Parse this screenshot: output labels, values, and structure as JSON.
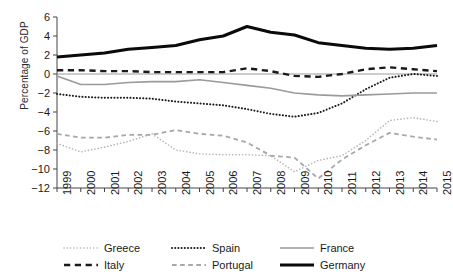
{
  "chart_data": {
    "type": "line",
    "title": "",
    "xlabel": "",
    "ylabel": "Percentage of GDP",
    "x": [
      1999,
      2000,
      2001,
      2002,
      2003,
      2004,
      2005,
      2006,
      2007,
      2008,
      2009,
      2010,
      2011,
      2012,
      2013,
      2014,
      2015
    ],
    "xlim": [
      1999,
      2015
    ],
    "ylim": [
      -12,
      6
    ],
    "yticks": [
      6,
      4,
      2,
      0,
      -2,
      -4,
      -6,
      -8,
      -10,
      -12
    ],
    "xticks": [
      "1999",
      "2000",
      "2001",
      "2002",
      "2003",
      "2004",
      "2005",
      "2006",
      "2007",
      "2008",
      "2009",
      "2010",
      "2011",
      "2012",
      "2013",
      "2014",
      "2015"
    ],
    "grid": false,
    "legend_position": "bottom",
    "zero_line": true,
    "series": [
      {
        "name": "Greece",
        "style": "dotted",
        "color": "#b4b4b4",
        "width": 1.6,
        "values": [
          -7.3,
          -8.2,
          -7.7,
          -7.1,
          -6.3,
          -8.0,
          -8.4,
          -8.5,
          -8.5,
          -8.6,
          -10.3,
          -9.1,
          -8.6,
          -7.0,
          -4.9,
          -4.6,
          -5.0
        ]
      },
      {
        "name": "Spain",
        "style": "dotted",
        "color": "#1a1a1a",
        "width": 2.0,
        "values": [
          -2.1,
          -2.4,
          -2.5,
          -2.5,
          -2.6,
          -2.9,
          -3.1,
          -3.3,
          -3.7,
          -4.2,
          -4.5,
          -4.1,
          -3.1,
          -1.6,
          -0.4,
          0.0,
          -0.2
        ]
      },
      {
        "name": "France",
        "style": "solid",
        "color": "#9a9a9a",
        "width": 1.6,
        "values": [
          -0.2,
          -1.1,
          -1.1,
          -0.9,
          -0.8,
          -0.8,
          -0.6,
          -0.9,
          -1.2,
          -1.5,
          -2.0,
          -2.2,
          -2.3,
          -2.2,
          -2.1,
          -2.0,
          -2.0
        ]
      },
      {
        "name": "Italy",
        "style": "dashed",
        "color": "#1a1a1a",
        "width": 2.4,
        "values": [
          0.4,
          0.4,
          0.3,
          0.3,
          0.2,
          0.2,
          0.2,
          0.2,
          0.6,
          0.3,
          -0.2,
          -0.3,
          0.0,
          0.5,
          0.7,
          0.5,
          0.3
        ]
      },
      {
        "name": "Portugal",
        "style": "dashed",
        "color": "#a8a8a8",
        "width": 1.8,
        "values": [
          -6.3,
          -6.7,
          -6.7,
          -6.4,
          -6.4,
          -5.9,
          -6.3,
          -6.5,
          -7.2,
          -8.6,
          -8.8,
          -11.0,
          -9.0,
          -7.5,
          -6.2,
          -6.6,
          -6.9
        ]
      },
      {
        "name": "Germany",
        "style": "solid",
        "color": "#0a0a0a",
        "width": 3.0,
        "values": [
          1.8,
          2.0,
          2.2,
          2.6,
          2.8,
          3.0,
          3.6,
          4.0,
          5.0,
          4.4,
          4.1,
          3.3,
          3.0,
          2.7,
          2.6,
          2.7,
          3.0
        ]
      }
    ]
  },
  "axis": {
    "y_label": "Percentage of GDP"
  },
  "legend": {
    "row1": [
      {
        "name": "Greece"
      },
      {
        "name": "Spain"
      },
      {
        "name": "France"
      }
    ],
    "row2": [
      {
        "name": "Italy"
      },
      {
        "name": "Portugal"
      },
      {
        "name": "Germany"
      }
    ]
  }
}
